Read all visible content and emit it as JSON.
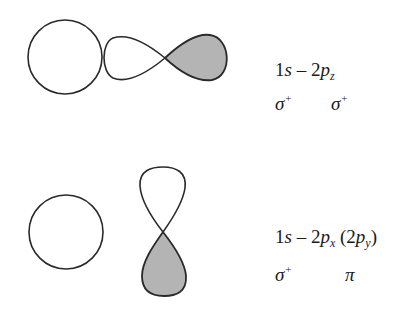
{
  "colors": {
    "stroke": "#2a2a2a",
    "negative_lobe_fill": "#b4b4b4",
    "positive_lobe_fill": "#ffffff",
    "background": "#ffffff"
  },
  "panels": [
    {
      "id": "sigma-overlap",
      "orbitals": [
        "1s",
        "2p_z"
      ],
      "orientation": "horizontal",
      "label": {
        "coef": "1",
        "s": "s",
        "minus": " – ",
        "coef2": "2",
        "p": "p",
        "sub1": "z",
        "extra_open": "",
        "extra_p": "",
        "extra_sub": "",
        "extra_close": ""
      },
      "symmetry": [
        {
          "symbol": "σ",
          "superscript": "+"
        },
        {
          "symbol": "σ",
          "superscript": "+"
        }
      ]
    },
    {
      "id": "pi-overlap",
      "orbitals": [
        "1s",
        "2p_x (2p_y)"
      ],
      "orientation": "vertical",
      "label": {
        "coef": "1",
        "s": "s",
        "minus": " – ",
        "coef2": "2",
        "p": "p",
        "sub1": "x",
        "extra_open": " (2",
        "extra_p": "p",
        "extra_sub": "y",
        "extra_close": ")"
      },
      "symmetry": [
        {
          "symbol": "σ",
          "superscript": "+"
        },
        {
          "symbol": "π",
          "superscript": ""
        }
      ]
    }
  ]
}
